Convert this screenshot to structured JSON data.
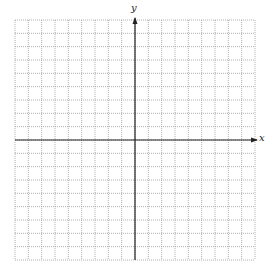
{
  "chart_data": {
    "type": "coordinate-grid",
    "title": "",
    "xlabel": "x",
    "ylabel": "y",
    "xlim": [
      -9,
      9
    ],
    "ylim": [
      -9,
      9
    ],
    "grid": true,
    "grid_style": "dotted",
    "tick_labels": false,
    "cells_x": 18,
    "cells_y": 18,
    "series": []
  },
  "layout": {
    "grid_left": 15,
    "grid_top": 20,
    "grid_size": 240,
    "cell": 13.333,
    "grid_color": "#9a9a9a",
    "axis_color": "#222222"
  },
  "labels": {
    "x_axis": "x",
    "y_axis": "y"
  }
}
